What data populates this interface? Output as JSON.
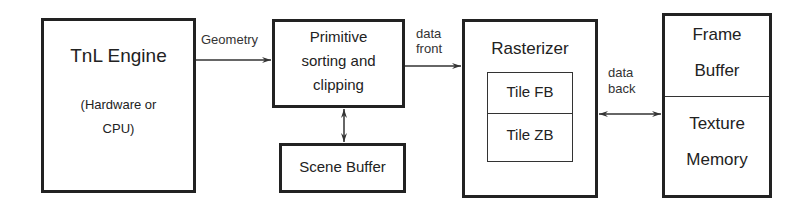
{
  "diagram": {
    "type": "block-diagram",
    "blocks": {
      "tnl": {
        "title": "TnL Engine",
        "subtitle_line1": "(Hardware or",
        "subtitle_line2": "CPU)"
      },
      "primitive": {
        "line1": "Primitive",
        "line2": "sorting and",
        "line3": "clipping"
      },
      "scene_buffer": {
        "title": "Scene Buffer"
      },
      "rasterizer": {
        "title": "Rasterizer",
        "tile_fb": "Tile FB",
        "tile_zb": "Tile ZB"
      },
      "memory": {
        "frame_line1": "Frame",
        "frame_line2": "Buffer",
        "texture_line1": "Texture",
        "texture_line2": "Memory"
      }
    },
    "edges": [
      {
        "from": "TnL Engine",
        "to": "Primitive sorting and clipping",
        "label": "Geometry",
        "direction": "forward"
      },
      {
        "from": "Primitive sorting and clipping",
        "to": "Rasterizer",
        "label": "data front",
        "direction": "forward"
      },
      {
        "from": "Primitive sorting and clipping",
        "to": "Scene Buffer",
        "label": "",
        "direction": "bidirectional"
      },
      {
        "from": "Rasterizer",
        "to": "Frame Buffer / Texture Memory",
        "label": "data back",
        "direction": "bidirectional"
      }
    ],
    "labels": {
      "geometry": "Geometry",
      "data_front_line1": "data",
      "data_front_line2": "front",
      "data_back_line1": "data",
      "data_back_line2": "back"
    },
    "colors": {
      "stroke": "#222222",
      "background": "#ffffff"
    }
  }
}
